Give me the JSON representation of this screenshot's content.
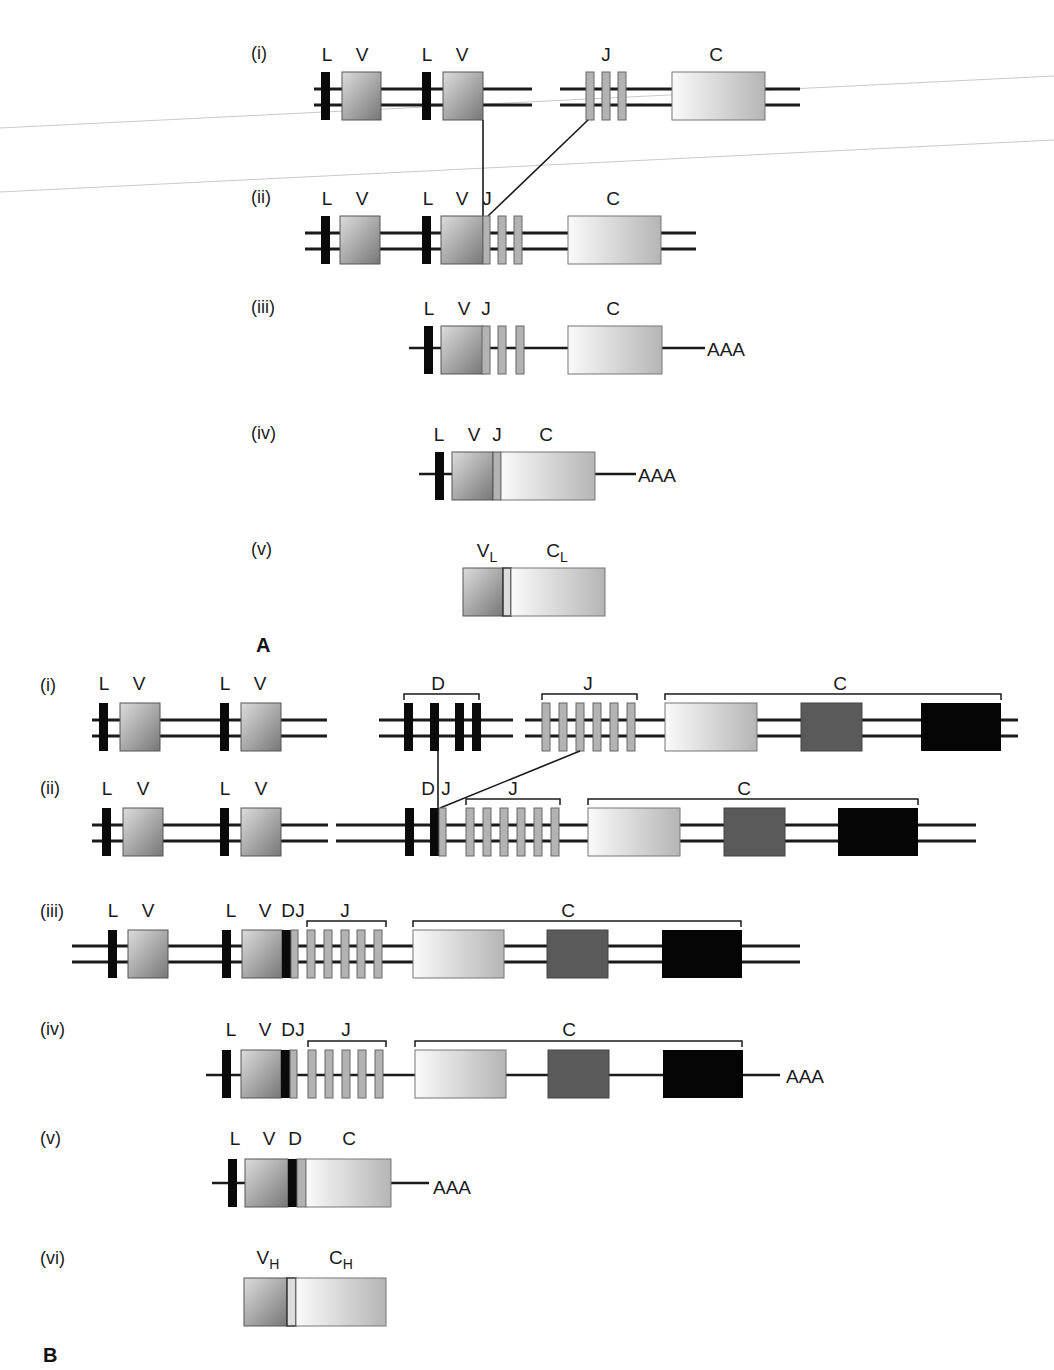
{
  "figure": {
    "panel_a_label": "A",
    "panel_b_label": "B",
    "colors": {
      "line": "#1a1a1a",
      "leader_exon": "#0a0a0a",
      "d_segment": "#0a0a0a",
      "j_segment": "#b3b3b3",
      "v_gradient_light": "#d9d9d9",
      "v_gradient_dark": "#7a7a7a",
      "c_gradient_light": "#f7f7f7",
      "c_gradient_dark": "#b8b8b8",
      "c2_dark_gray": "#5a5a5a",
      "c3_black": "#050505",
      "scan_artifact": "#c8c8c8"
    }
  },
  "panel_a": {
    "title": "Light chain (kappa) gene rearrangement",
    "rows": [
      {
        "id": "i",
        "label": "(i)",
        "desc": "germline DNA",
        "labels": [
          {
            "t": "L",
            "x": 327
          },
          {
            "t": "V",
            "x": 362
          },
          {
            "t": "L",
            "x": 427
          },
          {
            "t": "V",
            "x": 462
          },
          {
            "t": "J",
            "x": 606
          },
          {
            "t": "C",
            "x": 716
          }
        ]
      },
      {
        "id": "ii",
        "label": "(ii)",
        "desc": "rearranged DNA",
        "labels": [
          {
            "t": "L",
            "x": 327
          },
          {
            "t": "V",
            "x": 362
          },
          {
            "t": "L",
            "x": 428
          },
          {
            "t": "V",
            "x": 462
          },
          {
            "t": "J",
            "x": 487
          },
          {
            "t": "C",
            "x": 613
          }
        ]
      },
      {
        "id": "iii",
        "label": "(iii)",
        "desc": "primary transcript",
        "tail": "AAA",
        "labels": [
          {
            "t": "L",
            "x": 429
          },
          {
            "t": "V",
            "x": 464
          },
          {
            "t": "J",
            "x": 486
          },
          {
            "t": "C",
            "x": 613
          }
        ]
      },
      {
        "id": "iv",
        "label": "(iv)",
        "desc": "mRNA",
        "tail": "AAA",
        "labels": [
          {
            "t": "L",
            "x": 439
          },
          {
            "t": "V",
            "x": 474
          },
          {
            "t": "J",
            "x": 497
          },
          {
            "t": "C",
            "x": 546
          }
        ]
      },
      {
        "id": "v",
        "label": "(v)",
        "desc": "protein",
        "labels": [
          {
            "t": "V",
            "sub": "L",
            "x": 487
          },
          {
            "t": "C",
            "sub": "L",
            "x": 557
          }
        ]
      }
    ]
  },
  "panel_b": {
    "title": "Heavy chain gene rearrangement",
    "rows": [
      {
        "id": "i",
        "label": "(i)",
        "desc": "germline DNA",
        "labels": [
          {
            "t": "L",
            "x": 104
          },
          {
            "t": "V",
            "x": 139
          },
          {
            "t": "L",
            "x": 225
          },
          {
            "t": "V",
            "x": 260
          },
          {
            "t": "D",
            "x": 438
          },
          {
            "t": "J",
            "x": 588
          },
          {
            "t": "C",
            "x": 840
          }
        ]
      },
      {
        "id": "ii",
        "label": "(ii)",
        "desc": "D-J joined",
        "labels": [
          {
            "t": "L",
            "x": 107
          },
          {
            "t": "V",
            "x": 143
          },
          {
            "t": "L",
            "x": 225
          },
          {
            "t": "V",
            "x": 261
          },
          {
            "t": "D",
            "x": 428
          },
          {
            "t": "J",
            "x": 446
          },
          {
            "t": "J",
            "x": 513
          },
          {
            "t": "C",
            "x": 744
          }
        ]
      },
      {
        "id": "iii",
        "label": "(iii)",
        "desc": "V-DJ joined",
        "labels": [
          {
            "t": "L",
            "x": 113
          },
          {
            "t": "V",
            "x": 148
          },
          {
            "t": "L",
            "x": 231
          },
          {
            "t": "V",
            "x": 265
          },
          {
            "t": "D",
            "x": 288
          },
          {
            "t": "J",
            "x": 300
          },
          {
            "t": "J",
            "x": 345
          },
          {
            "t": "C",
            "x": 568
          }
        ]
      },
      {
        "id": "iv",
        "label": "(iv)",
        "desc": "primary transcript",
        "tail": "AAA",
        "labels": [
          {
            "t": "L",
            "x": 231
          },
          {
            "t": "V",
            "x": 265
          },
          {
            "t": "D",
            "x": 288
          },
          {
            "t": "J",
            "x": 300
          },
          {
            "t": "J",
            "x": 346
          },
          {
            "t": "C",
            "x": 569
          }
        ]
      },
      {
        "id": "v",
        "label": "(v)",
        "desc": "mRNA",
        "tail": "AAA",
        "labels": [
          {
            "t": "L",
            "x": 235
          },
          {
            "t": "V",
            "x": 269
          },
          {
            "t": "D",
            "x": 295
          },
          {
            "t": "C",
            "x": 349
          }
        ]
      },
      {
        "id": "vi",
        "label": "(vi)",
        "desc": "protein",
        "labels": [
          {
            "t": "V",
            "sub": "H",
            "x": 268
          },
          {
            "t": "C",
            "sub": "H",
            "x": 341
          }
        ]
      }
    ]
  }
}
